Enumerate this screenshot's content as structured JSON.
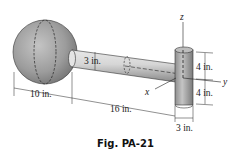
{
  "figure": {
    "caption": "Fig. PA-21",
    "type": "3D engineering drawing: sphere attached to a horizontal rod ending in a vertical cylinder",
    "axes": {
      "x": "x",
      "y": "y",
      "z": "z"
    },
    "dimensions": {
      "sphere_diameter": "10 in.",
      "rod_diameter": "3 in.",
      "rod_length": "16 in.",
      "cylinder_upper_half": "4 in.",
      "cylinder_lower_half": "4 in.",
      "cylinder_diameter": "3 in."
    },
    "colors": {
      "sphere": "#9a9a9a",
      "rod": "#c8c8c8",
      "cylinder": "#a8a8a8",
      "lines": "#222222"
    }
  }
}
